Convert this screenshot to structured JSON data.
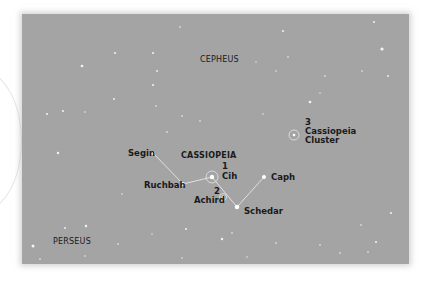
{
  "image": {
    "description": "Star field photograph with Cassiopeia constellation annotations",
    "background_color": "#a4a4a4",
    "line_color": "#e8e8e8"
  },
  "constellations": [
    {
      "name": "CEPHEUS",
      "bold": false
    },
    {
      "name": "CASSIOPEIA",
      "bold": true
    },
    {
      "name": "PERSEUS",
      "bold": false
    }
  ],
  "stars": [
    {
      "name": "Segin"
    },
    {
      "name": "Ruchbah"
    },
    {
      "name": "Cih",
      "number": "1"
    },
    {
      "name": "Achird",
      "number": "2"
    },
    {
      "name": "Caph"
    },
    {
      "name": "Schedar"
    }
  ],
  "objects": [
    {
      "number": "3",
      "name_line1": "Cassiopeia",
      "name_line2": "Cluster"
    }
  ]
}
